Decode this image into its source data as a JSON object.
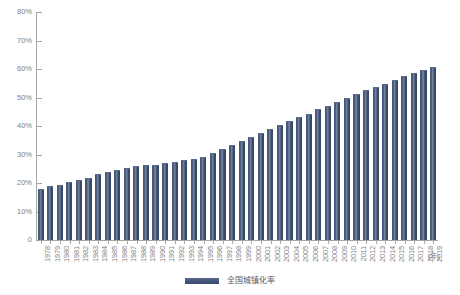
{
  "chart_data": {
    "type": "bar",
    "title": "",
    "xlabel": "(年)",
    "ylabel": "",
    "ylim": [
      0,
      80
    ],
    "grid": false,
    "legend_position": "bottom-center",
    "series_name": "全国城镇化率",
    "bar_color": "#44547a",
    "axis_color": "#a6a6a6",
    "text_color": "#7f7f7f",
    "ytick_labels": [
      "80%",
      "70%",
      "60%",
      "50%",
      "40%",
      "30%",
      "20%",
      "10%"
    ],
    "ytick_values": [
      80,
      70,
      60,
      50,
      40,
      30,
      20,
      10
    ],
    "origin_label": "0",
    "categories": [
      "1978",
      "1979",
      "1980",
      "1981",
      "1982",
      "1983",
      "1984",
      "1985",
      "1986",
      "1987",
      "1988",
      "1989",
      "1990",
      "1991",
      "1992",
      "1993",
      "1994",
      "1995",
      "1996",
      "1997",
      "1998",
      "1999",
      "2000",
      "2001",
      "2002",
      "2003",
      "2004",
      "2005",
      "2006",
      "2007",
      "2008",
      "2009",
      "2010",
      "2011",
      "2012",
      "2013",
      "2014",
      "2015",
      "2016",
      "2017",
      "2018",
      "2019"
    ],
    "values": [
      17.9,
      19.0,
      19.4,
      20.2,
      21.1,
      21.6,
      23.0,
      23.7,
      24.5,
      25.3,
      25.8,
      26.2,
      26.4,
      26.9,
      27.5,
      28.0,
      28.5,
      29.0,
      30.5,
      31.9,
      33.4,
      34.8,
      36.2,
      37.7,
      39.1,
      40.5,
      41.8,
      43.0,
      44.3,
      45.9,
      47.0,
      48.3,
      49.9,
      51.3,
      52.6,
      53.7,
      54.8,
      56.1,
      57.4,
      58.5,
      59.6,
      60.6
    ]
  },
  "legend": {
    "label": "全国城镇化率"
  }
}
